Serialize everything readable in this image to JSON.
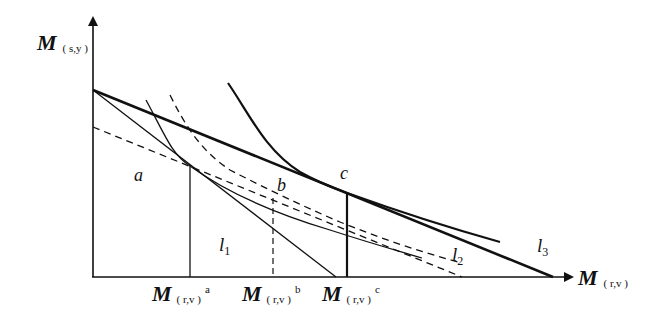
{
  "diagram": {
    "axes": {
      "y_label_main": "M",
      "y_label_sub": "( s,y )",
      "x_label_main": "M",
      "x_label_sub": "( r,v )"
    },
    "points": {
      "a": "a",
      "b": "b",
      "c": "c"
    },
    "lines": {
      "l1_main": "l",
      "l1_sub": "1",
      "l2_main": "l",
      "l2_sub": "2",
      "l3_main": "l",
      "l3_sub": "3"
    },
    "x_ticks": [
      {
        "main": "M",
        "sub": "( r,v )",
        "sup": "a"
      },
      {
        "main": "M",
        "sub": "( r,v )",
        "sup": "b"
      },
      {
        "main": "M",
        "sub": "( r,v )",
        "sup": "c"
      }
    ],
    "colors": {
      "ink": "#111111",
      "background": "#ffffff"
    }
  }
}
